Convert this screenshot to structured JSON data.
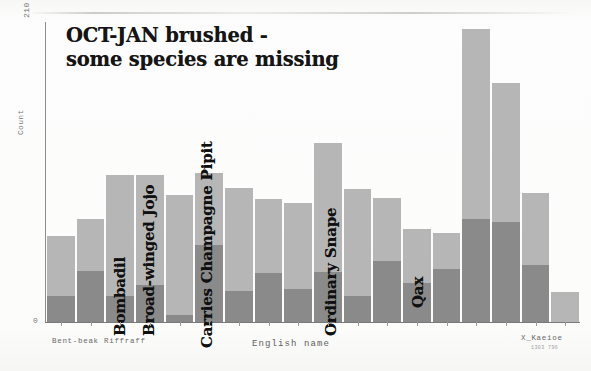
{
  "figure": {
    "title": "OCT-JAN brushed -\nsome species are missing",
    "xlabel": "English name",
    "ylabel": "Count",
    "y_top_tick": "210",
    "y_bottom_tick": "0",
    "xtick_left": "Bent-beak Riffraff",
    "xtick_right": "X_Kaeioe",
    "xtick_right_sub": "1303 796",
    "colors": {
      "bar_light": "#b6b6b6",
      "bar_dark": "#8a8a8a",
      "axis": "#7a7a7a",
      "text": "#151515",
      "paper": "#fdfdfc"
    }
  },
  "annotations": [
    {
      "label": "Bombadil",
      "left": 129,
      "bottom": 318
    },
    {
      "label": "Broad-winged Jojo",
      "left": 158,
      "bottom": 318
    },
    {
      "label": "Carries Champagne Pipit",
      "left": 216,
      "bottom": 330
    },
    {
      "label": "Ordinary Snape",
      "left": 340,
      "bottom": 318
    },
    {
      "label": "Qax",
      "left": 427,
      "bottom": 290
    }
  ],
  "chart_data": {
    "type": "bar",
    "subtype": "stacked",
    "title": "OCT-JAN brushed - some species are missing",
    "xlabel": "English name",
    "ylabel": "Count",
    "ylim": [
      0,
      210
    ],
    "grid": false,
    "legend": null,
    "categories": [
      "Bent-beak Riffraff",
      "",
      "Bombadil",
      "Broad-winged Jojo",
      "",
      "Carries Champagne Pipit",
      "",
      "",
      "",
      "",
      "Ordinary Snape",
      "",
      "",
      "Qax",
      "",
      "",
      "",
      "X_Kaeioe"
    ],
    "series": [
      {
        "name": "lower",
        "color": "#8a8a8a",
        "values": [
          18,
          36,
          18,
          26,
          5,
          54,
          22,
          34,
          23,
          35,
          18,
          43,
          27,
          37,
          72,
          70,
          40,
          0
        ]
      },
      {
        "name": "upper",
        "color": "#b6b6b6",
        "values": [
          42,
          36,
          85,
          77,
          84,
          50,
          72,
          52,
          60,
          90,
          75,
          44,
          38,
          25,
          133,
          97,
          50,
          21
        ]
      }
    ],
    "totals": [
      60,
      72,
      103,
      103,
      89,
      104,
      94,
      86,
      83,
      125,
      93,
      87,
      65,
      62,
      205,
      167,
      90,
      21
    ]
  }
}
